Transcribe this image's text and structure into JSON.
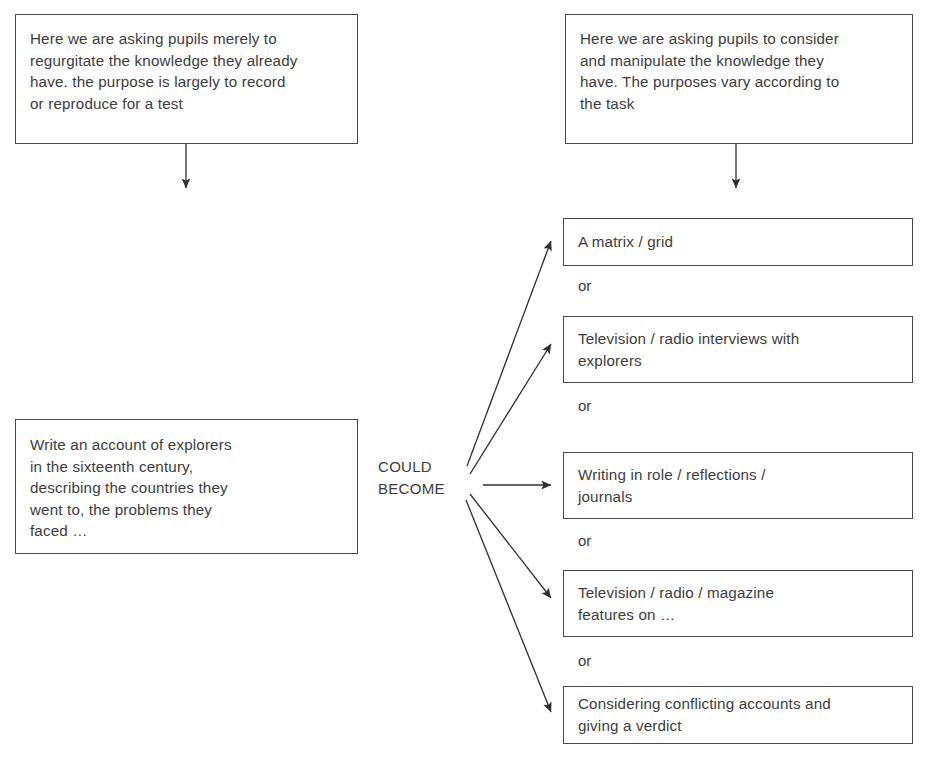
{
  "diagram": {
    "title_hidden": "",
    "connector_label": "COULD\nBECOME",
    "or_label": "or",
    "line_color": "#4a4a4a",
    "text_color": "#3d3d3d",
    "background": "#ffffff"
  },
  "left_column": {
    "annotation": "Here we are asking pupils merely to\nregurgitate the knowledge they already\nhave. the purpose is largely to record\nor reproduce for a test",
    "task": "Write an account of explorers\nin the sixteenth century,\ndescribing the countries they\nwent to, the problems they\nfaced …"
  },
  "right_column": {
    "annotation": "Here we are asking pupils to consider\nand manipulate the knowledge they\nhave. The purposes vary according to\nthe task",
    "options": [
      {
        "text": "A matrix / grid"
      },
      {
        "text": "Television / radio interviews with\nexplorers"
      },
      {
        "text": "Writing in role / reflections /\njournals"
      },
      {
        "text": "Television / radio / magazine\nfeatures on  …"
      },
      {
        "text": "Considering conflicting accounts and\ngiving a verdict"
      }
    ],
    "separators": [
      "or",
      "or",
      "or",
      "or"
    ]
  }
}
